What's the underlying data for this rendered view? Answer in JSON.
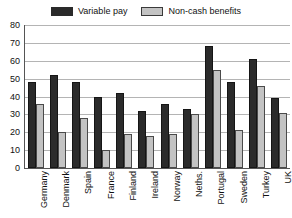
{
  "chart_data": {
    "type": "bar",
    "title": "",
    "subtitle": "",
    "xlabel": "",
    "ylabel": "",
    "ylim": [
      0,
      80
    ],
    "ytick_step": 10,
    "yticks": [
      "80",
      "70",
      "60",
      "50",
      "40",
      "30",
      "20",
      "10",
      "0"
    ],
    "grid": true,
    "legend_position": "top-center",
    "orientation": "vertical",
    "categories": [
      "Germany",
      "Denmark",
      "Spain",
      "France",
      "Finland",
      "Ireland",
      "Norway",
      "Neths.",
      "Portugal",
      "Sweden",
      "Turkey",
      "UK"
    ],
    "series": [
      {
        "name": "Variable pay",
        "color": "#2b2b2b",
        "values": [
          48,
          52,
          48,
          40,
          42,
          32,
          36,
          33,
          68,
          48,
          61,
          39
        ]
      },
      {
        "name": "Non-cash benefits",
        "color": "#c3c3c3",
        "values": [
          36,
          20,
          28,
          10,
          19,
          18,
          19,
          30,
          55,
          21,
          46,
          31
        ]
      }
    ]
  },
  "legend": {
    "entries": [
      {
        "label": "Variable pay"
      },
      {
        "label": "Non-cash benefits"
      }
    ]
  },
  "colors": {
    "series_variable_pay": "#2b2b2b",
    "series_non_cash_benefits": "#c3c3c3",
    "gridline": "#b4b4b4",
    "axis": "#555555",
    "background": "#ffffff",
    "text": "#111111"
  }
}
